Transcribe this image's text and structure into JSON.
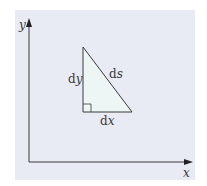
{
  "diagram": {
    "axes": {
      "x_label": "x",
      "y_label": "y"
    },
    "triangle": {
      "vertical_side": {
        "prefix": "d",
        "var": "y"
      },
      "horizontal_side": {
        "prefix": "d",
        "var": "x"
      },
      "hypotenuse": {
        "prefix": "d",
        "var": "s"
      },
      "right_angle_marker": true
    },
    "colors": {
      "panel": "#e8ebf3",
      "triangle_fill": "#eef6f5",
      "lines": "#3a3a3a"
    }
  }
}
